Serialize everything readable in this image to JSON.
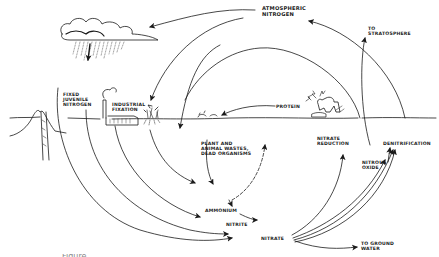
{
  "diagram": {
    "type": "nitrogen-cycle",
    "style": "hand-drawn line illustration",
    "colors": {
      "ink": "#1a1a1a",
      "background": "#ffffff"
    },
    "labels": {
      "atmospheric_nitrogen": "ATMOSPHERIC\nNITROGEN",
      "to_stratosphere": "TO\nSTRATOSPHERE",
      "fixed_juvenile_nitrogen": "FIXED\nJUVENILE\nNITROGEN",
      "industrial_fixation": "INDUSTRIAL\nFIXATION",
      "protein": "PROTEIN",
      "plant_animal_wastes": "PLANT and\nANIMAL WASTES,\nDEAD ORGANISMS",
      "nitrate_reduction": "NITRATE\nREDUCTION",
      "denitrification": "DENITRIFICATION",
      "nitrous_oxide": "NITROUS\nOXIDE",
      "ammonium": "AMMONIUM",
      "nitrite": "NITRITE",
      "nitrate": "NITRATE",
      "to_ground_water": "TO GROUND\nWATER"
    },
    "caption": "Figure ..."
  }
}
